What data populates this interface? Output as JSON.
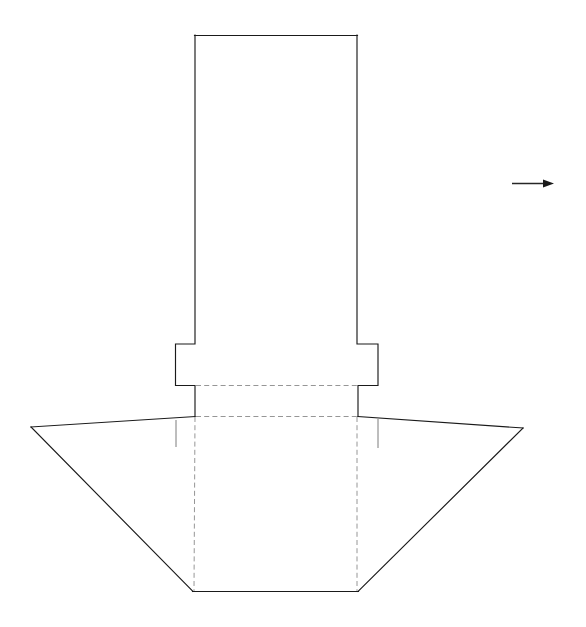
{
  "drawing": {
    "title": "Column Base Elevation",
    "view_label": "front elevation",
    "canvas": {
      "width": 586,
      "height": 627,
      "background": "#ffffff"
    },
    "colors": {
      "solid_line": "#1a1a1a",
      "hidden_line": "#8a8a8a",
      "thin_line": "#6e6e6e",
      "annotation": "#262626",
      "paper": "#ffffff"
    },
    "line_styles": {
      "solid": "solid visible outline",
      "hidden": "dashed hidden outline",
      "thin": "thin construction tick"
    },
    "parts": [
      {
        "id": "shaft",
        "name": "column-shaft",
        "description": "tall vertical rectangular shaft",
        "shape": "rectangle",
        "points": "195,35 357,35 357,344",
        "top_y": 35,
        "left_x": 195,
        "right_x": 357
      },
      {
        "id": "collar",
        "name": "collar-flange",
        "description": "projecting collar band around shaft",
        "shape": "stepped-band",
        "left_x": 175,
        "right_x": 378,
        "top_y": 344,
        "bottom_y": 385
      },
      {
        "id": "pedestal",
        "name": "pedestal-block",
        "description": "shaft continues below collar to base plate level",
        "shape": "rectangle",
        "left_x": 195,
        "right_x": 358,
        "top_y": 385,
        "bottom_y": 416
      },
      {
        "id": "base",
        "name": "base-footing",
        "description": "wide flaring trapezoidal footing seen in elevation",
        "shape": "trapezoid",
        "left_apex": "31,427",
        "right_apex": "523,428",
        "bottom_left": "193,592",
        "bottom_right": "358,592"
      }
    ],
    "hidden_edges": [
      {
        "id": "collar-underside",
        "name": "hidden-line-collar-underside",
        "from": "195,385",
        "to": "358,385"
      },
      {
        "id": "base-top",
        "name": "hidden-line-base-top",
        "from": "195,416",
        "to": "357,416"
      },
      {
        "id": "shaft-left-projection",
        "name": "hidden-line-left-vertical",
        "from": "195,416",
        "to": "194,592"
      },
      {
        "id": "shaft-right-projection",
        "name": "hidden-line-right-vertical",
        "from": "357,416",
        "to": "357,592"
      }
    ],
    "tick_marks": [
      {
        "id": "tick-left",
        "name": "construction-tick-left",
        "x": 176,
        "y1": 420,
        "y2": 447
      },
      {
        "id": "tick-right",
        "name": "construction-tick-right",
        "x": 378,
        "y1": 419,
        "y2": 448
      }
    ],
    "annotations": [
      {
        "id": "direction-arrow",
        "name": "direction-arrow",
        "type": "arrow",
        "label": "",
        "direction": "right",
        "from_x": 512,
        "from_y": 183,
        "to_x": 554,
        "to_y": 183,
        "head_length": 11,
        "head_half_width": 4
      }
    ]
  }
}
